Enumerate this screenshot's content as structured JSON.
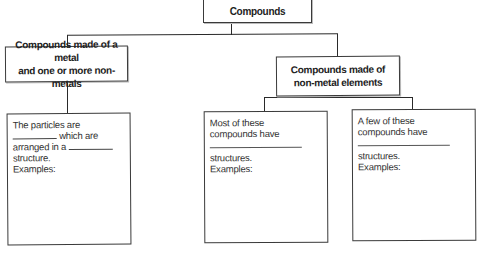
{
  "diagram": {
    "root": {
      "label": "Compounds"
    },
    "branches": [
      {
        "label_line1": "Compounds made of a metal",
        "label_line2": "and one or more non-metals",
        "children": [
          {
            "line1": "The particles are",
            "line2_after_blank": "which are",
            "line3_before_blank": "arranged in a",
            "line4": "structure.",
            "line5": "Examples:"
          }
        ]
      },
      {
        "label_line1": "Compounds made of",
        "label_line2": "non-metal elements",
        "children": [
          {
            "line1": "Most of these",
            "line2": "compounds have",
            "line3": "structures.",
            "line4": "Examples:"
          },
          {
            "line1": "A few of these",
            "line2": "compounds have",
            "line3": "structures.",
            "line4": "Examples:"
          }
        ]
      }
    ]
  },
  "colors": {
    "line": "#2a2a2a",
    "border": "#3a3a3a",
    "background": "#ffffff"
  }
}
